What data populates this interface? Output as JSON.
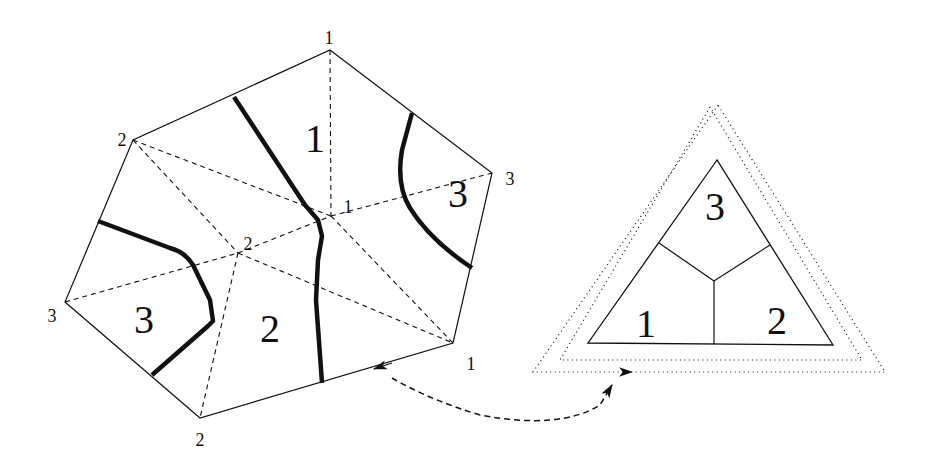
{
  "diagram": {
    "colors": {
      "ink": "#111111",
      "background": "#ffffff"
    },
    "left_figure": {
      "outer_polygon": [
        [
          330,
          50
        ],
        [
          492,
          173
        ],
        [
          453,
          343
        ],
        [
          200,
          418
        ],
        [
          65,
          302
        ],
        [
          133,
          140
        ]
      ],
      "dashed_edges": [
        [
          [
            330,
            50
          ],
          [
            331,
            216
          ]
        ],
        [
          [
            133,
            140
          ],
          [
            331,
            216
          ]
        ],
        [
          [
            133,
            140
          ],
          [
            238,
            253
          ]
        ],
        [
          [
            65,
            302
          ],
          [
            238,
            253
          ]
        ],
        [
          [
            238,
            253
          ],
          [
            331,
            216
          ]
        ],
        [
          [
            331,
            216
          ],
          [
            492,
            173
          ]
        ],
        [
          [
            331,
            216
          ],
          [
            453,
            343
          ]
        ],
        [
          [
            238,
            253
          ],
          [
            453,
            343
          ]
        ],
        [
          [
            238,
            253
          ],
          [
            200,
            418
          ]
        ]
      ],
      "thick_curves": [
        "M 234 97 L 305 205 L 318 220 L 322 236 L 318 260 L 316 300 L 322 383",
        "M 412 113 L 402 150 Q 396 185 410 208 Q 430 240 472 268",
        "M 98 221 L 170 248 Q 185 252 193 265 L 210 300 L 213 321 L 208 326 L 152 375"
      ],
      "vertex_labels": [
        {
          "text": "1",
          "x": 329,
          "y": 44
        },
        {
          "text": "3",
          "x": 510,
          "y": 185
        },
        {
          "text": "1",
          "x": 471,
          "y": 370
        },
        {
          "text": "2",
          "x": 200,
          "y": 446
        },
        {
          "text": "3",
          "x": 52,
          "y": 322
        },
        {
          "text": "2",
          "x": 122,
          "y": 146
        },
        {
          "text": "1",
          "x": 348,
          "y": 213
        },
        {
          "text": "2",
          "x": 248,
          "y": 250
        }
      ],
      "region_labels": [
        {
          "text": "1",
          "x": 315,
          "y": 152
        },
        {
          "text": "3",
          "x": 458,
          "y": 207
        },
        {
          "text": "3",
          "x": 144,
          "y": 333
        },
        {
          "text": "2",
          "x": 270,
          "y": 342
        }
      ],
      "arrow": {
        "tip": [
          374,
          369
        ],
        "from": [
          453,
          343
        ]
      }
    },
    "right_figure": {
      "triangle": [
        [
          717,
          160
        ],
        [
          588,
          343
        ],
        [
          833,
          345
        ]
      ],
      "dividers": [
        [
          [
            659,
            243
          ],
          [
            714,
            281
          ]
        ],
        [
          [
            770,
            245
          ],
          [
            714,
            281
          ]
        ],
        [
          [
            714,
            281
          ],
          [
            714,
            344
          ]
        ]
      ],
      "region_labels": [
        {
          "text": "3",
          "x": 715,
          "y": 220
        },
        {
          "text": "1",
          "x": 646,
          "y": 337
        },
        {
          "text": "2",
          "x": 777,
          "y": 334
        }
      ],
      "dotted_outline_1": [
        [
          710,
          107
        ],
        [
          560,
          360
        ],
        [
          862,
          360
        ]
      ],
      "dotted_outline_2": [
        [
          718,
          105
        ],
        [
          533,
          372
        ],
        [
          885,
          372
        ]
      ],
      "arrow": {
        "tip": [
          632,
          372
        ],
        "from": [
          604,
          372
        ]
      }
    },
    "connector": {
      "path": "M 392 378 Q 430 400 480 415 Q 560 430 600 405 L 612 385",
      "style": "dashed-curve-with-arrowhead"
    }
  }
}
